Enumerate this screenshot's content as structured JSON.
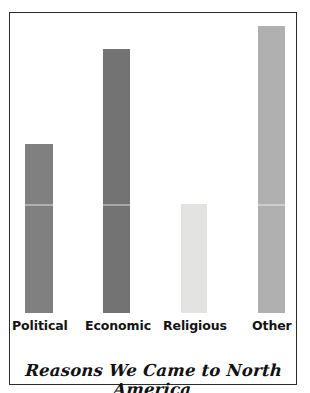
{
  "chart_data": {
    "type": "bar",
    "title": "Reasons We Came to North America",
    "xlabel": "",
    "ylabel": "",
    "grid": false,
    "legend": false,
    "ylim": [
      0,
      100
    ],
    "categories": [
      "Political",
      "Economic",
      "Religious",
      "Other"
    ],
    "values": [
      59,
      92,
      38,
      100
    ],
    "bar_colors": [
      "#808080",
      "#737373",
      "#e3e3e1",
      "#b0b0b0"
    ]
  },
  "figure": {
    "background": "#ffffff",
    "frame_color": "#2b2b2b"
  }
}
